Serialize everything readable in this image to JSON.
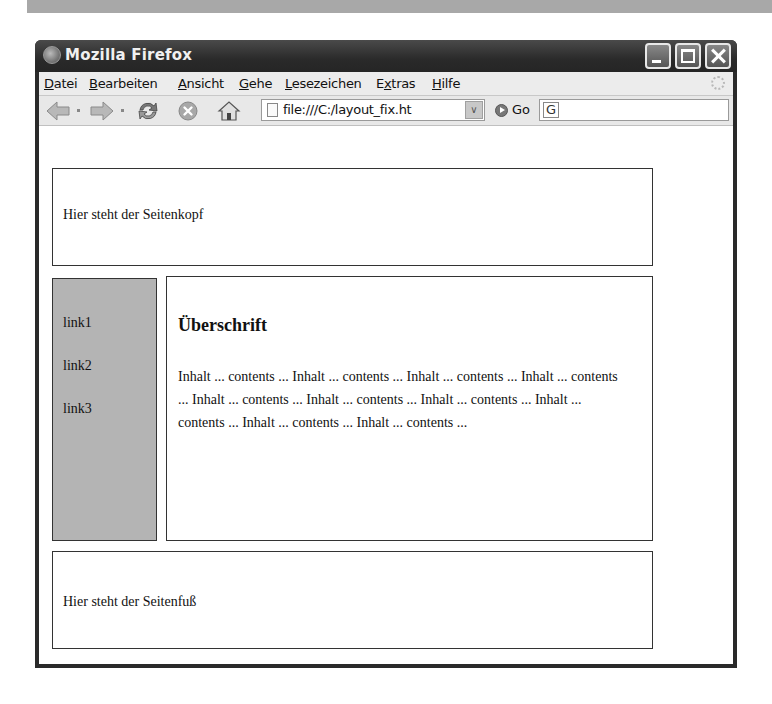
{
  "window": {
    "title": "Mozilla Firefox"
  },
  "menubar": {
    "items": [
      {
        "label": "Datei",
        "accel": "D"
      },
      {
        "label": "Bearbeiten",
        "accel": "B"
      },
      {
        "label": "Ansicht",
        "accel": "A"
      },
      {
        "label": "Gehe",
        "accel": "G"
      },
      {
        "label": "Lesezeichen",
        "accel": "L"
      },
      {
        "label": "Extras",
        "accel": "x"
      },
      {
        "label": "Hilfe",
        "accel": "H"
      }
    ]
  },
  "navbar": {
    "url": "file:///C:/layout_fix.ht",
    "go_label": "Go",
    "search_engine_glyph": "G",
    "icons": [
      "back-icon",
      "forward-icon",
      "reload-icon",
      "stop-icon",
      "home-icon"
    ]
  },
  "page": {
    "header_text": "Hier steht der Seitenkopf",
    "nav_links": [
      "link1",
      "link2",
      "link3"
    ],
    "heading": "Überschrift",
    "paragraph": "Inhalt ... contents ... Inhalt ... contents ... Inhalt ... contents ... Inhalt ... contents ... Inhalt ... contents ... Inhalt ... contents ... Inhalt ... contents ... Inhalt ... contents ... Inhalt ... contents ... Inhalt ... contents ...",
    "footer_text": "Hier steht der Seitenfuß",
    "nav_background": "#b4b4b4"
  }
}
